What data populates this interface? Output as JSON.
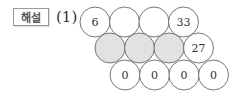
{
  "badge_label": "해설",
  "problem_number": "(1)",
  "rows": [
    [
      {
        "text": "6",
        "shaded": false
      },
      {
        "text": "",
        "shaded": false
      },
      {
        "text": "",
        "shaded": false
      },
      {
        "text": "33",
        "shaded": false
      }
    ],
    [
      {
        "text": "",
        "shaded": true
      },
      {
        "text": "",
        "shaded": true
      },
      {
        "text": "",
        "shaded": true
      },
      {
        "text": "27",
        "shaded": false
      }
    ],
    [
      {
        "text": "0",
        "shaded": false
      },
      {
        "text": "0",
        "shaded": false
      },
      {
        "text": "0",
        "shaded": false
      },
      {
        "text": "0",
        "shaded": false
      }
    ]
  ],
  "colors": {
    "shade": "#e2e2e2",
    "stroke": "#666666",
    "text": "#333333"
  }
}
